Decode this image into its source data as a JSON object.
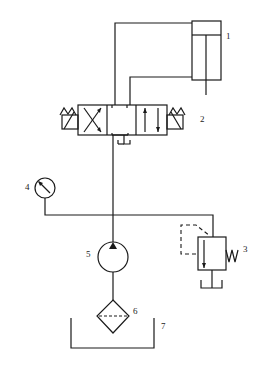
{
  "diagram": {
    "type": "hydraulic-circuit",
    "components": [
      {
        "id": "1",
        "label": "1",
        "name": "hydraulic-cylinder"
      },
      {
        "id": "2",
        "label": "2",
        "name": "directional-control-valve-3-position-solenoid"
      },
      {
        "id": "3",
        "label": "3",
        "name": "relief-valve"
      },
      {
        "id": "4",
        "label": "4",
        "name": "pressure-gauge"
      },
      {
        "id": "5",
        "label": "5",
        "name": "hydraulic-pump"
      },
      {
        "id": "6",
        "label": "6",
        "name": "filter"
      },
      {
        "id": "7",
        "label": "7",
        "name": "oil-tank"
      }
    ],
    "colors": {
      "stroke": "#1a1a1a",
      "background": "#ffffff"
    }
  }
}
